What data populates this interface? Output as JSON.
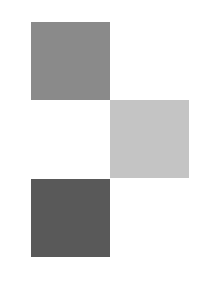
{
  "canvas": {
    "width": 208,
    "height": 281,
    "background": "#ffffff"
  },
  "squares": [
    {
      "name": "medium-gray-square",
      "x": 31,
      "y": 22,
      "w": 79,
      "h": 78,
      "color": "#8a8a8a"
    },
    {
      "name": "light-gray-square",
      "x": 110,
      "y": 100,
      "w": 79,
      "h": 78,
      "color": "#c4c4c4"
    },
    {
      "name": "dark-gray-square",
      "x": 31,
      "y": 179,
      "w": 79,
      "h": 78,
      "color": "#595959"
    }
  ]
}
